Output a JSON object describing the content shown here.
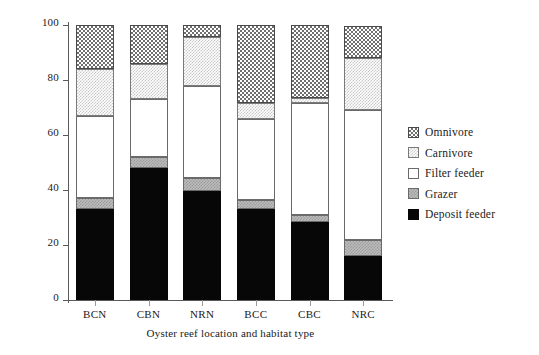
{
  "chart_data": {
    "type": "bar",
    "stacked": true,
    "title": "",
    "xlabel": "Oyster reef location and habitat type",
    "ylabel": "Percent",
    "categories": [
      "BCN",
      "CBN",
      "NRN",
      "BCC",
      "CBC",
      "NRC"
    ],
    "ylim": [
      0,
      100
    ],
    "yticks": [
      0,
      20,
      40,
      60,
      80,
      100
    ],
    "grid": false,
    "legend_position": "right",
    "series": [
      {
        "name": "Deposit feeder",
        "values": [
          33,
          48,
          39.5,
          33,
          28.5,
          16
        ]
      },
      {
        "name": "Grazer",
        "values": [
          4,
          4,
          5,
          3.5,
          2.5,
          6
        ]
      },
      {
        "name": "Filter feeder",
        "values": [
          30,
          21,
          33.5,
          29.5,
          40.5,
          47
        ]
      },
      {
        "name": "Carnivore",
        "values": [
          17,
          13,
          17.5,
          5.5,
          2,
          19
        ]
      },
      {
        "name": "Omnivore",
        "values": [
          16,
          14,
          4.5,
          28.5,
          26.5,
          11.5
        ]
      }
    ],
    "stack_order_bottom_to_top": [
      "Deposit feeder",
      "Grazer",
      "Filter feeder",
      "Carnivore",
      "Omnivore"
    ],
    "cumulative_tops": {
      "BCN": [
        33,
        37,
        67,
        84,
        100
      ],
      "CBN": [
        48,
        52,
        73,
        86,
        100
      ],
      "NRN": [
        39.5,
        44.5,
        78,
        95.5,
        100
      ],
      "BCC": [
        33,
        36.5,
        66,
        71.5,
        100
      ],
      "CBC": [
        28.5,
        31,
        71.5,
        73.5,
        100
      ],
      "NRC": [
        16,
        22,
        69,
        88,
        100
      ]
    }
  },
  "axes": {
    "y_title": "Percent",
    "x_title": "Oyster reef location and habitat type",
    "y_tick_labels": [
      "100",
      "80",
      "60",
      "40",
      "20",
      "0"
    ],
    "x_tick_labels": [
      "BCN",
      "CBN",
      "NRN",
      "BCC",
      "CBC",
      "NRC"
    ]
  },
  "legend": {
    "items": [
      {
        "label": "Omnivore",
        "pattern": "checkerboard-dark"
      },
      {
        "label": "Carnivore",
        "pattern": "checkerboard-light"
      },
      {
        "label": "Filter feeder",
        "pattern": "white"
      },
      {
        "label": "Grazer",
        "pattern": "gray"
      },
      {
        "label": "Deposit feeder",
        "pattern": "black"
      }
    ]
  }
}
